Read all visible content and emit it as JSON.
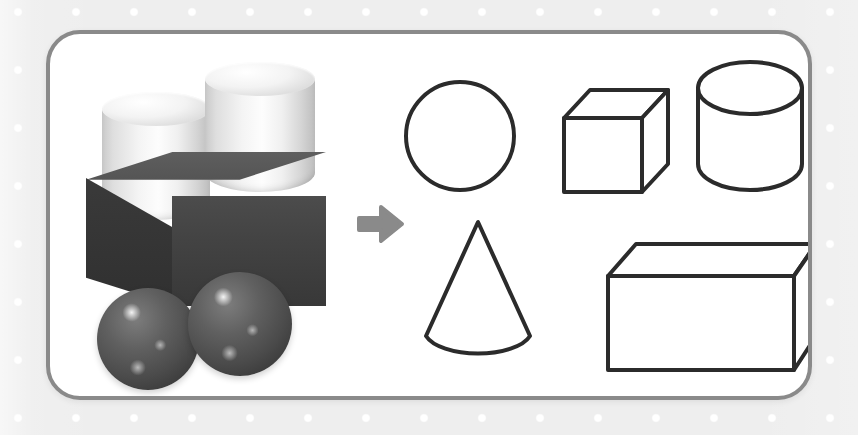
{
  "page": {
    "background_color": "#eeeeee",
    "dot_color": "#ffffff",
    "card_background": "#ffffff",
    "card_border_color": "#8a8a8a"
  },
  "card": {
    "left_panel_label": "Toy block construction photograph",
    "right_panel_label": "Matching geometric solids diagram"
  },
  "arrow": {
    "icon": "arrow-right-icon",
    "direction": "right",
    "color": "#8a8a8a",
    "label": "leads to"
  },
  "photo": {
    "label": "Stacked toy block figure",
    "objects": [
      {
        "name": "cylinder",
        "label": "White cylinder (left)",
        "color": "#f2f2f2",
        "count_position": "top-left"
      },
      {
        "name": "cylinder",
        "label": "White cylinder (right)",
        "color": "#f2f2f2",
        "count_position": "top-right"
      },
      {
        "name": "rectangular-prism",
        "label": "Dark rectangular block",
        "color": "#434343",
        "count_position": "middle"
      },
      {
        "name": "sphere",
        "label": "Dark sphere (left)",
        "color": "#4b4b4b",
        "count_position": "bottom-left"
      },
      {
        "name": "sphere",
        "label": "Dark sphere (right)",
        "color": "#4b4b4b",
        "count_position": "bottom-right"
      }
    ]
  },
  "shapes": {
    "stroke_color": "#2b2b2b",
    "fill_color": "#ffffff",
    "items": [
      {
        "id": "circle",
        "name": "circle",
        "label": "Circle",
        "row": 1,
        "column": 1
      },
      {
        "id": "cube",
        "name": "cube",
        "label": "Cube",
        "row": 1,
        "column": 2
      },
      {
        "id": "cylinder",
        "name": "cylinder",
        "label": "Cylinder",
        "row": 1,
        "column": 3
      },
      {
        "id": "cone",
        "name": "cone",
        "label": "Cone",
        "row": 2,
        "column": 1
      },
      {
        "id": "rectangular-prism",
        "name": "rectangular-prism",
        "label": "Rectangular prism",
        "row": 2,
        "column": 2
      }
    ]
  }
}
